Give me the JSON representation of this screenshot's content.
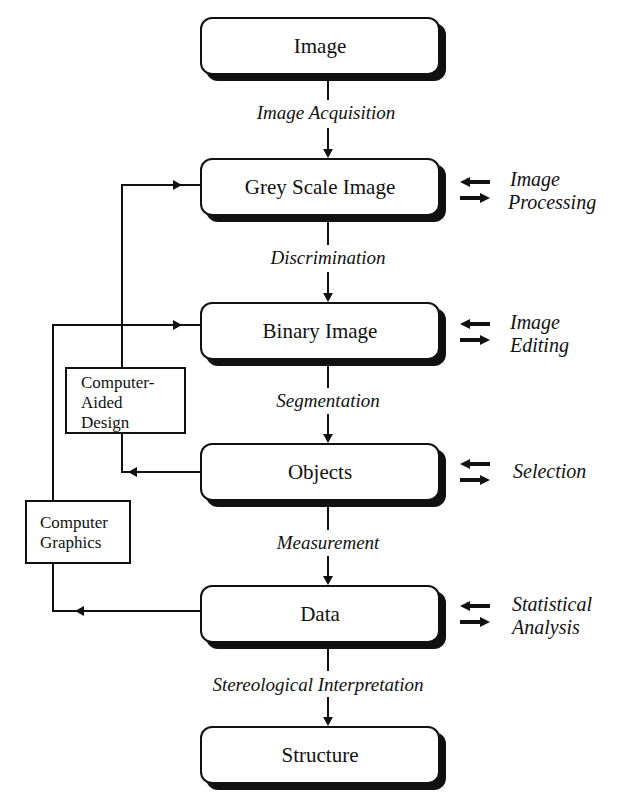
{
  "diagram": {
    "nodes": [
      {
        "id": "image",
        "label": "Image"
      },
      {
        "id": "grey_scale_image",
        "label": "Grey Scale Image"
      },
      {
        "id": "binary_image",
        "label": "Binary Image"
      },
      {
        "id": "objects",
        "label": "Objects"
      },
      {
        "id": "data",
        "label": "Data"
      },
      {
        "id": "structure",
        "label": "Structure"
      }
    ],
    "transitions": [
      {
        "from": "image",
        "to": "grey_scale_image",
        "label": "Image Acquisition"
      },
      {
        "from": "grey_scale_image",
        "to": "binary_image",
        "label": "Discrimination"
      },
      {
        "from": "binary_image",
        "to": "objects",
        "label": "Segmentation"
      },
      {
        "from": "objects",
        "to": "data",
        "label": "Measurement"
      },
      {
        "from": "data",
        "to": "structure",
        "label": "Stereological Interpretation"
      }
    ],
    "side_operations": [
      {
        "node": "grey_scale_image",
        "lines": [
          "Image",
          "Processing"
        ]
      },
      {
        "node": "binary_image",
        "lines": [
          "Image",
          "Editing"
        ]
      },
      {
        "node": "objects",
        "lines": [
          "Selection"
        ]
      },
      {
        "node": "data",
        "lines": [
          "Statistical",
          "Analysis"
        ]
      }
    ],
    "feedback_boxes": [
      {
        "id": "cad",
        "lines": [
          "Computer-",
          "Aided",
          "Design"
        ],
        "from": "objects",
        "to": "grey_scale_image"
      },
      {
        "id": "graphics",
        "lines": [
          "Computer",
          "Graphics"
        ],
        "from": "data",
        "to": "binary_image"
      }
    ],
    "arrow_icons": {
      "bidirectional": "left-right-arrows"
    }
  }
}
